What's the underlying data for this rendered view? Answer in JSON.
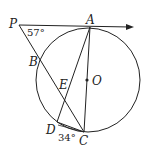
{
  "diagram": {
    "type": "circle-geometry",
    "points": {
      "P": "P",
      "A": "A",
      "B": "B",
      "E": "E",
      "O": "O",
      "D": "D",
      "C": "C"
    },
    "angles": {
      "P": "57°",
      "C": "34°"
    },
    "colors": {
      "stroke": "#222222",
      "background": "#ffffff"
    }
  }
}
